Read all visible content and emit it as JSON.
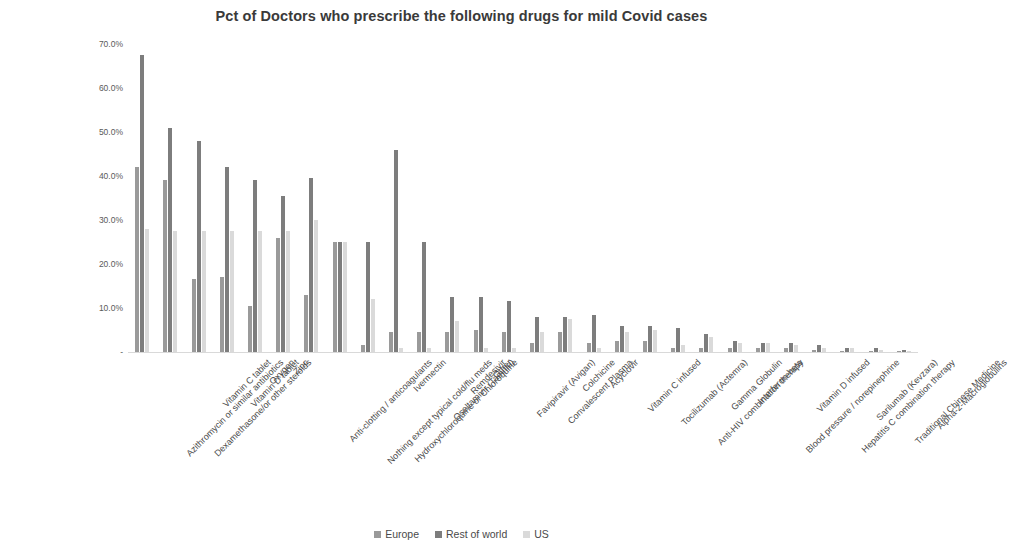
{
  "chart_data": {
    "type": "bar",
    "title": "Pct of Doctors who prescribe the following drugs for mild Covid cases",
    "xlabel": "",
    "ylabel": "",
    "ylim": [
      0,
      70
    ],
    "grid": false,
    "legend_position": "bottom",
    "ytick_labels": [
      "70.0%",
      "60.0%",
      "50.0%",
      "40.0%",
      "30.0%",
      "20.0%",
      "10.0%",
      "-"
    ],
    "ytick_values": [
      70,
      60,
      50,
      40,
      30,
      20,
      10,
      0
    ],
    "categories": [
      "Azithromycin or similar antibiotics",
      "Dexamethasone/or other steroids",
      "Vitamin C tablet",
      "Vitamin D tablet",
      "Oxygen",
      "Zinc",
      "Anti-clotting / anticoagulants",
      "Nothing except typical cold/flu meds",
      "Hydroxychloroquine or Chloroquine",
      "Ivermectin",
      "Oseltamivir (Tamiflu)",
      "Remdesivir",
      "Other",
      "Favipiravir (Avigan)",
      "Convalescent Plasma",
      "Colchicine",
      "Acyclovir",
      "Vitamin C infused",
      "Tocilizumab (Actemra)",
      "Anti-HIV combination therapy",
      "Gamma Globulin",
      "Interferon-beta",
      "Blood pressure / norepinephrine",
      "Vitamin D infused",
      "Hepatitis C combination therapy",
      "Sarilumab (Kevzara)",
      "Traditional Chinese Medicine",
      "Alpha-2-Macroglobulins"
    ],
    "series": [
      {
        "name": "Europe",
        "color": "#9a9a9a",
        "values": [
          42.0,
          39.0,
          16.5,
          17.0,
          10.5,
          26.0,
          13.0,
          25.0,
          1.5,
          4.5,
          4.5,
          4.5,
          5.0,
          4.5,
          2.0,
          4.5,
          2.0,
          2.5,
          2.5,
          1.0,
          1.0,
          0.8,
          1.0,
          0.8,
          0.5,
          0.3,
          0.3,
          0.2
        ]
      },
      {
        "name": "Rest of world",
        "color": "#7d7d7d",
        "values": [
          67.5,
          51.0,
          48.0,
          42.0,
          39.0,
          35.5,
          39.5,
          25.0,
          25.0,
          46.0,
          25.0,
          12.5,
          12.5,
          11.5,
          8.0,
          8.0,
          8.5,
          6.0,
          6.0,
          5.5,
          4.0,
          2.5,
          2.0,
          2.0,
          1.5,
          1.0,
          0.8,
          0.5
        ]
      },
      {
        "name": "US",
        "color": "#dadada",
        "values": [
          28.0,
          27.5,
          27.5,
          27.5,
          27.5,
          27.5,
          30.0,
          25.0,
          12.0,
          1.0,
          1.0,
          7.0,
          1.0,
          1.0,
          4.5,
          7.5,
          1.0,
          4.5,
          5.0,
          1.5,
          3.5,
          2.0,
          2.0,
          1.5,
          1.0,
          0.8,
          0.4,
          0.3
        ]
      }
    ]
  },
  "legend": {
    "items": [
      {
        "label": "Europe",
        "color": "#9a9a9a"
      },
      {
        "label": "Rest of world",
        "color": "#7d7d7d"
      },
      {
        "label": "US",
        "color": "#dadada"
      }
    ]
  }
}
